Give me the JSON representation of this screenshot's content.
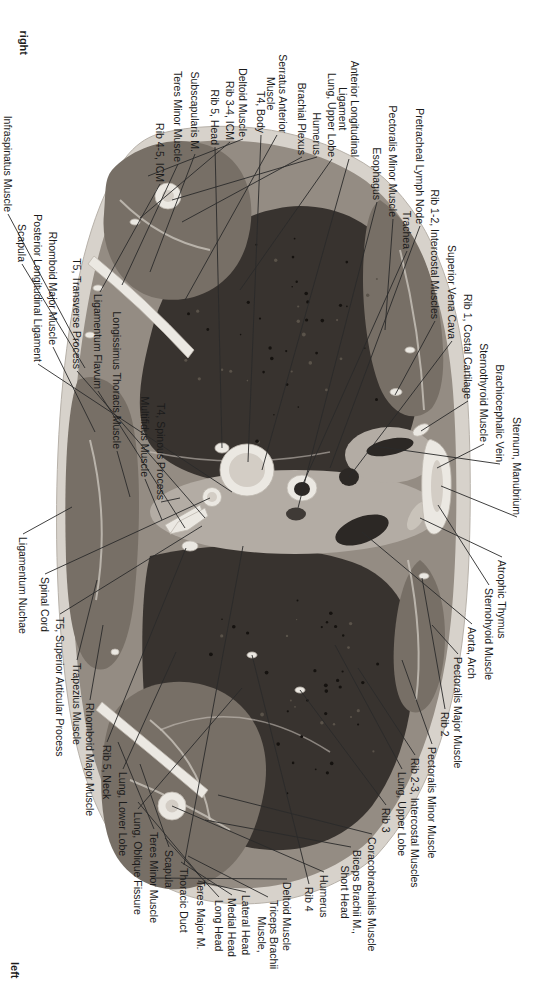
{
  "figure": {
    "type": "anatomical-cross-section",
    "description_visible_text_only": true,
    "orientation_top_corner": "right",
    "orientation_bottom_corner": "left"
  },
  "colors": {
    "ink": "#1b1b1b",
    "line": "#2a2a2a",
    "fat": "#d7d2cb",
    "rim": "#b7b1a9",
    "muscle": "#948c83",
    "muscle_dark": "#776f66",
    "lung": "#38332f",
    "mediastinum": "#b3aca4",
    "bone": "#ebe8e2",
    "bone_edge": "#beb7ae",
    "marrow": "#d3cdc5",
    "vessel": "#2c2825",
    "fascia": "#cfc9c1",
    "speck_dark": "#15120f",
    "speck_light": "#5a534a"
  },
  "labels": [
    {
      "t": "right",
      "x": 24,
      "y": 55,
      "g": "t",
      "b": true
    },
    {
      "t": "left",
      "x": 15,
      "y": 962,
      "g": "b",
      "b": true
    },
    {
      "t": "Infraspinatus Muscle",
      "x": 8,
      "y": 212,
      "g": "t",
      "tx": 78,
      "ty": 345
    },
    {
      "t": "Scapula",
      "x": 22,
      "y": 262,
      "g": "t",
      "tx": 85,
      "ty": 368
    },
    {
      "t": "Posterior Longitudinal Ligament",
      "x": 38,
      "y": 362,
      "g": "t",
      "tx": 232,
      "ty": 492
    },
    {
      "t": "Rhomboid Major Muscle",
      "x": 53,
      "y": 345,
      "g": "t",
      "tx": 95,
      "ty": 432
    },
    {
      "t": "T5, Transverse Process",
      "x": 77,
      "y": 369,
      "g": "t",
      "tx": 205,
      "ty": 518
    },
    {
      "t": "Ligamentum Flavum",
      "x": 98,
      "y": 389,
      "g": "t",
      "tx": 185,
      "ty": 528
    },
    {
      "t": "Longissimus Thoracis Muscle",
      "x": 117,
      "y": 449,
      "g": "t",
      "tx": 130,
      "ty": 497
    },
    {
      "t": "Multifidus Muscle",
      "x": 145,
      "y": 477,
      "g": "t",
      "tx": 162,
      "ty": 520
    },
    {
      "t": "T4, Spinous Process",
      "x": 161,
      "y": 500,
      "g": "t",
      "tx": 180,
      "ty": 498
    },
    {
      "t": "Rib 4-5, ICM",
      "x": 160,
      "y": 182,
      "g": "t",
      "tx": 100,
      "ty": 292
    },
    {
      "t": "Teres Minor Muscle",
      "x": 178,
      "y": 162,
      "g": "t",
      "tx": 122,
      "ty": 285
    },
    {
      "t": "Subscapularis M.",
      "x": 195,
      "y": 152,
      "g": "t",
      "tx": 150,
      "ty": 272
    },
    {
      "t": "Rib 5, Head",
      "x": 215,
      "y": 145,
      "g": "t",
      "tx": 222,
      "ty": 448
    },
    {
      "t": "Rib 3-4, ICM",
      "x": 230,
      "y": 140,
      "g": "t",
      "tx": 140,
      "ty": 218
    },
    {
      "t": "Deltoid Muscle",
      "x": 243,
      "y": 137,
      "g": "t",
      "tx": 148,
      "ty": 176
    },
    {
      "t": "T4, Body",
      "x": 261,
      "y": 133,
      "g": "t",
      "tx": 248,
      "ty": 462
    },
    {
      "t": "Serratus Anterior\nMuscle",
      "x": 277,
      "y": 133,
      "g": "t",
      "tx": 185,
      "ty": 300
    },
    {
      "t": "Brachial Plexus",
      "x": 302,
      "y": 155,
      "g": "t",
      "tx": 182,
      "ty": 222
    },
    {
      "t": "Humerus",
      "x": 317,
      "y": 155,
      "g": "t",
      "tx": 172,
      "ty": 200
    },
    {
      "t": "Lung, Upper Lobe",
      "x": 332,
      "y": 157,
      "g": "t",
      "tx": 240,
      "ty": 290
    },
    {
      "t": "Anterior Longitudinal\nLigament",
      "x": 349,
      "y": 157,
      "g": "t",
      "tx": 262,
      "ty": 470
    },
    {
      "t": "Esophagus",
      "x": 377,
      "y": 200,
      "g": "t",
      "tx": 298,
      "ty": 508
    },
    {
      "t": "Pectoralis Minor Muscle",
      "x": 393,
      "y": 217,
      "g": "t",
      "tx": 385,
      "ty": 330
    },
    {
      "t": "Trachea",
      "x": 407,
      "y": 249,
      "g": "t",
      "tx": 302,
      "ty": 486
    },
    {
      "t": "Pretracheal Lymph Node",
      "x": 420,
      "y": 224,
      "g": "t",
      "tx": 330,
      "ty": 468
    },
    {
      "t": "Rib 1-2, Intercostal Muscles",
      "x": 435,
      "y": 319,
      "g": "t",
      "tx": 395,
      "ty": 395
    },
    {
      "t": "Superior Vena Cava",
      "x": 452,
      "y": 339,
      "g": "t",
      "tx": 349,
      "ty": 477
    },
    {
      "t": "Rib 1, Costal Cartilage",
      "x": 468,
      "y": 399,
      "g": "t",
      "tx": 421,
      "ty": 431
    },
    {
      "t": "Sternothyroid Muscle",
      "x": 484,
      "y": 442,
      "g": "t",
      "tx": 437,
      "ty": 468
    },
    {
      "t": "Brachiocephalic Vein",
      "x": 500,
      "y": 462,
      "g": "t",
      "tx": 374,
      "ty": 446
    },
    {
      "t": "Sternum, Manubrium",
      "x": 517,
      "y": 515,
      "g": "t",
      "tx": 441,
      "ty": 486
    },
    {
      "t": "Ligamentum Nuchae",
      "x": 23,
      "y": 537,
      "g": "b",
      "tx": 72,
      "ty": 507
    },
    {
      "t": "Spinal Cord",
      "x": 45,
      "y": 577,
      "g": "b",
      "tx": 210,
      "ty": 498
    },
    {
      "t": "T5, Superior Articular Process",
      "x": 60,
      "y": 617,
      "g": "b",
      "tx": 202,
      "ty": 526
    },
    {
      "t": "Trapezius Muscle",
      "x": 77,
      "y": 663,
      "g": "b",
      "tx": 97,
      "ty": 580
    },
    {
      "t": "Rhomboid Major Muscle",
      "x": 90,
      "y": 703,
      "g": "b",
      "tx": 103,
      "ty": 625
    },
    {
      "t": "Rib 5, Neck",
      "x": 107,
      "y": 745,
      "g": "b",
      "tx": 186,
      "ty": 548
    },
    {
      "t": "Lung, Lower Lobe",
      "x": 123,
      "y": 772,
      "g": "b",
      "tx": 176,
      "ty": 652
    },
    {
      "t": "Lung, Oblique Fissure",
      "x": 138,
      "y": 812,
      "g": "b",
      "tx": 242,
      "ty": 688
    },
    {
      "t": "Teres Minor Muscle",
      "x": 154,
      "y": 832,
      "g": "b",
      "tx": 118,
      "ty": 742
    },
    {
      "t": "Scapula",
      "x": 169,
      "y": 850,
      "g": "b",
      "tx": 140,
      "ty": 764
    },
    {
      "t": "Thoracic Duct",
      "x": 184,
      "y": 868,
      "g": "b",
      "tx": 243,
      "ty": 546
    },
    {
      "t": "Teres Major M.",
      "x": 201,
      "y": 880,
      "g": "b",
      "tx": 138,
      "ty": 802
    },
    {
      "t": "Long Head",
      "x": 219,
      "y": 900,
      "g": "b",
      "tx": 165,
      "ty": 838
    },
    {
      "t": "Medial Head",
      "x": 232,
      "y": 898,
      "g": "b",
      "tx": 181,
      "ty": 862
    },
    {
      "t": "Lateral Head",
      "x": 246,
      "y": 895,
      "g": "b",
      "tx": 198,
      "ty": 881
    },
    {
      "t": "Triceps Brachii\nMuscle,",
      "x": 268,
      "y": 900,
      "g": "b",
      "tx": 188,
      "ty": 856
    },
    {
      "t": "Deltoid Muscle",
      "x": 287,
      "y": 882,
      "g": "b",
      "tx": 151,
      "ty": 878
    },
    {
      "t": "Rib 4",
      "x": 309,
      "y": 887,
      "g": "b",
      "tx": 252,
      "ty": 655
    },
    {
      "t": "Humerus",
      "x": 324,
      "y": 875,
      "g": "b",
      "tx": 172,
      "ty": 806
    },
    {
      "t": "Biceps Brachii M.,\nShort Head",
      "x": 351,
      "y": 850,
      "g": "b",
      "tx": 205,
      "ty": 820
    },
    {
      "t": "Coracobrachialis Muscle",
      "x": 372,
      "y": 837,
      "g": "b",
      "tx": 218,
      "ty": 795
    },
    {
      "t": "Rib 3",
      "x": 386,
      "y": 808,
      "g": "b",
      "tx": 300,
      "ty": 690
    },
    {
      "t": "Lung, Upper Lobe",
      "x": 402,
      "y": 772,
      "g": "b",
      "tx": 335,
      "ty": 645
    },
    {
      "t": "Rib 2-3, Intercostal Muscles",
      "x": 415,
      "y": 758,
      "g": "b",
      "tx": 358,
      "ty": 668
    },
    {
      "t": "Pectoralis Minor Muscle",
      "x": 432,
      "y": 747,
      "g": "b",
      "tx": 402,
      "ty": 660
    },
    {
      "t": "Rib 2",
      "x": 445,
      "y": 712,
      "g": "b",
      "tx": 422,
      "ty": 578
    },
    {
      "t": "Pectoralis Major Muscle",
      "x": 458,
      "y": 657,
      "g": "b",
      "tx": 432,
      "ty": 625
    },
    {
      "t": "Aorta, Arch",
      "x": 472,
      "y": 627,
      "g": "b",
      "tx": 362,
      "ty": 532
    },
    {
      "t": "Sternohyoid Muscle",
      "x": 489,
      "y": 588,
      "g": "b",
      "tx": 438,
      "ty": 505
    },
    {
      "t": "Atrophic Thymus",
      "x": 502,
      "y": 560,
      "g": "b",
      "tx": 420,
      "ty": 518
    }
  ]
}
